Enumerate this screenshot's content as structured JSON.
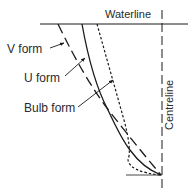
{
  "diagram": {
    "labels": {
      "waterline": "Waterline",
      "centreline": "Centreline",
      "v_form": "V form",
      "u_form": "U form",
      "bulb_form": "Bulb form"
    },
    "line_styles": {
      "v_form": "long-dash",
      "u_form": "solid",
      "bulb_form": "dotted",
      "centreline": "dash"
    },
    "colors": {
      "stroke": "#1a1a1a",
      "text": "#2a2a2a",
      "background": "#ffffff"
    }
  }
}
